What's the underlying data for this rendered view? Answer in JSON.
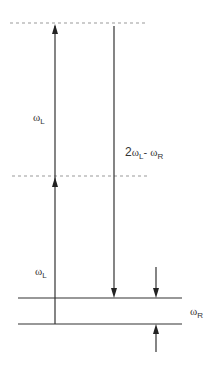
{
  "diagram": {
    "type": "energy-level-diagram",
    "colors": {
      "line": "#333333",
      "dashed": "#999999",
      "background": "#ffffff"
    },
    "levels": [
      {
        "id": "virtual-upper",
        "style": "dashed",
        "y": 23
      },
      {
        "id": "virtual-middle",
        "style": "dashed",
        "y": 176
      },
      {
        "id": "excited-vibrational",
        "style": "solid",
        "y": 298
      },
      {
        "id": "ground",
        "style": "solid",
        "y": 324
      }
    ],
    "arrows": [
      {
        "id": "pump-1",
        "direction": "up",
        "label": "ωL"
      },
      {
        "id": "pump-2",
        "direction": "up",
        "label": "ωL"
      },
      {
        "id": "anti-stokes",
        "direction": "down",
        "label": "2ωL - ωR"
      },
      {
        "id": "raman-gap",
        "direction": "inward",
        "label": "ωR"
      }
    ],
    "labels": {
      "upper_pump": {
        "symbol": "ω",
        "sub": "L"
      },
      "lower_pump": {
        "symbol": "ω",
        "sub": "L"
      },
      "signal": {
        "prefix": "2",
        "symbol1": "ω",
        "sub1": "L",
        "minus": "- ",
        "symbol2": "ω",
        "sub2": "R"
      },
      "raman": {
        "symbol": "ω",
        "sub": "R"
      }
    }
  }
}
